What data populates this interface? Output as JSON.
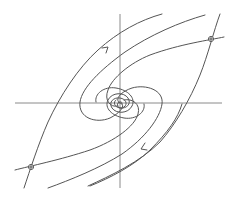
{
  "diagram": {
    "type": "phase-portrait",
    "colors": {
      "background": "#ffffff",
      "axes": "#8a8a8a",
      "trajectories": "#555555"
    },
    "origin": {
      "x": 120,
      "y": 103
    },
    "axes": {
      "horizontal": {
        "x1": 15,
        "y1": 103,
        "x2": 222,
        "y2": 103
      },
      "vertical": {
        "x1": 120,
        "y1": 14,
        "x2": 120,
        "y2": 188
      }
    },
    "fixed_points": [
      {
        "name": "saddle-upper-right",
        "x": 211,
        "y": 39,
        "kind": "open-circle"
      },
      {
        "name": "saddle-lower-left",
        "x": 31,
        "y": 167,
        "kind": "open-circle"
      },
      {
        "name": "spiral-center",
        "x": 120,
        "y": 103,
        "kind": "stable-spiral"
      }
    ],
    "arrows": [
      {
        "name": "arrow-upper-left-branch",
        "x": 108,
        "y": 48,
        "direction": "up-right"
      },
      {
        "name": "arrow-lower-right-branch",
        "x": 143,
        "y": 148,
        "direction": "down-left"
      }
    ]
  }
}
